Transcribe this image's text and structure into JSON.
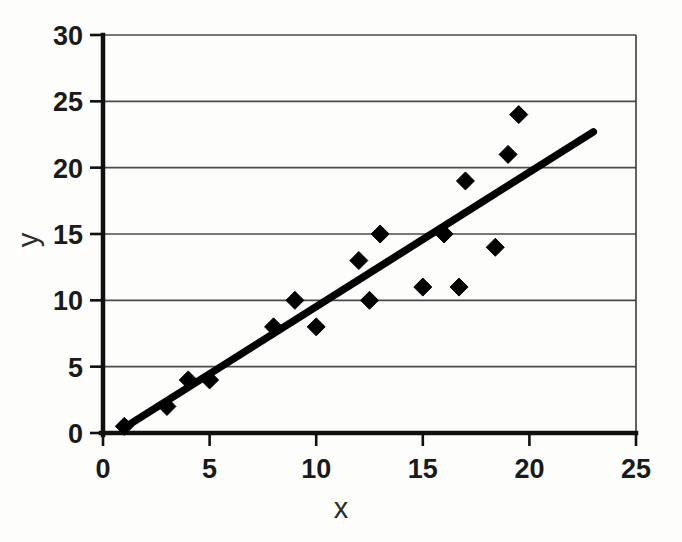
{
  "chart_data": {
    "type": "scatter",
    "title": "",
    "xlabel": "x",
    "ylabel": "y",
    "xlim": [
      0,
      25
    ],
    "ylim": [
      0,
      30
    ],
    "xticks": [
      0,
      5,
      10,
      15,
      20,
      25
    ],
    "yticks": [
      0,
      5,
      10,
      15,
      20,
      25,
      30
    ],
    "xtick_labels": [
      "0",
      "5",
      "10",
      "15",
      "20",
      "25"
    ],
    "ytick_labels": [
      "0",
      "5",
      "10",
      "15",
      "20",
      "25",
      "30"
    ],
    "grid": "horizontal",
    "legend": "none",
    "marker_shape": "diamond",
    "marker_color": "#000000",
    "points": [
      {
        "x": 1,
        "y": 0.5
      },
      {
        "x": 3,
        "y": 2
      },
      {
        "x": 4,
        "y": 4
      },
      {
        "x": 5,
        "y": 4
      },
      {
        "x": 8,
        "y": 8
      },
      {
        "x": 9,
        "y": 10
      },
      {
        "x": 10,
        "y": 8
      },
      {
        "x": 12,
        "y": 13
      },
      {
        "x": 12.5,
        "y": 10
      },
      {
        "x": 13,
        "y": 15
      },
      {
        "x": 15,
        "y": 11
      },
      {
        "x": 16,
        "y": 15
      },
      {
        "x": 16.7,
        "y": 11
      },
      {
        "x": 17,
        "y": 19
      },
      {
        "x": 18.4,
        "y": 14
      },
      {
        "x": 19,
        "y": 21
      },
      {
        "x": 19.5,
        "y": 24
      }
    ],
    "trendline": {
      "type": "linear-fit",
      "color": "#000000",
      "x_start": 1,
      "y_start": 0.4,
      "x_end": 23,
      "y_end": 22.7,
      "slope": 1.014,
      "intercept": -0.61
    }
  },
  "axes": {
    "x_axis_name": "x-axis",
    "y_axis_name": "y-axis"
  }
}
